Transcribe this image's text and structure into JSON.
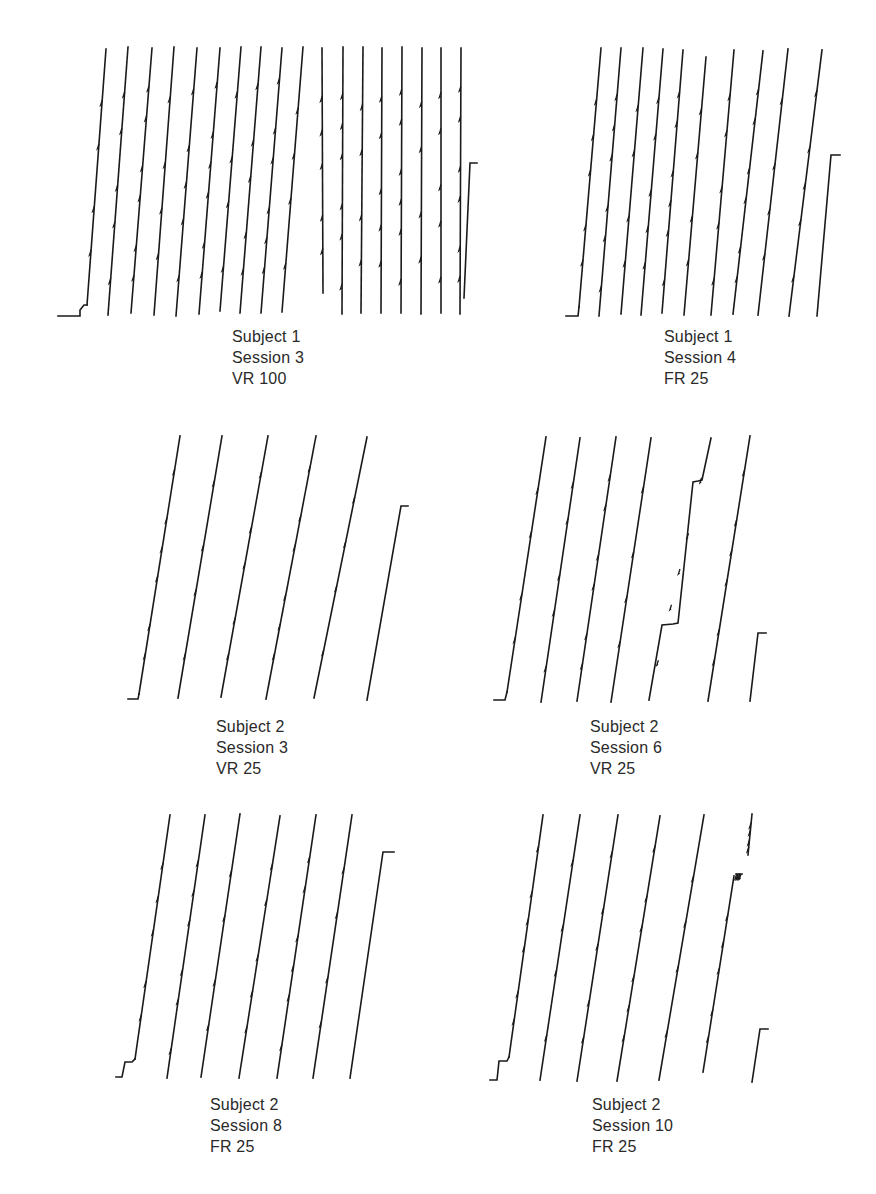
{
  "figure": {
    "type": "cumulative_records"
  },
  "panels": [
    {
      "id": "p1",
      "caption": {
        "subject": "Subject 1",
        "session": "Session 3",
        "schedule": "VR 100"
      },
      "caption_pos": [
        232,
        326
      ],
      "start_step": [
        [
          58,
          316
        ],
        [
          80,
          316
        ],
        [
          80,
          310
        ],
        [
          84,
          305
        ],
        [
          87,
          305
        ]
      ],
      "strokes": [
        [
          87,
          305,
          106,
          49
        ],
        [
          108,
          315,
          128,
          47
        ],
        [
          131,
          313,
          152,
          48
        ],
        [
          154,
          315,
          174,
          47
        ],
        [
          176,
          316,
          197,
          48
        ],
        [
          199,
          314,
          220,
          48
        ],
        [
          220,
          311,
          241,
          47
        ],
        [
          240,
          313,
          261,
          47
        ],
        [
          261,
          313,
          282,
          48
        ],
        [
          282,
          312,
          303,
          47
        ],
        [
          323,
          293,
          322,
          48
        ],
        [
          342,
          314,
          343,
          47
        ],
        [
          361,
          313,
          363,
          47
        ],
        [
          381,
          313,
          382,
          48
        ],
        [
          401,
          313,
          402,
          47
        ],
        [
          421,
          314,
          422,
          48
        ],
        [
          441,
          313,
          441,
          48
        ],
        [
          460,
          314,
          461,
          48
        ]
      ],
      "end_segment": [
        [
          464,
          298
        ],
        [
          470,
          163
        ],
        [
          477,
          163
        ]
      ]
    },
    {
      "id": "p2",
      "caption": {
        "subject": "Subject 1",
        "session": "Session 4",
        "schedule": "FR 25"
      },
      "caption_pos": [
        664,
        326
      ],
      "start_step": [
        [
          566,
          316
        ],
        [
          578,
          316
        ],
        [
          579,
          307
        ]
      ],
      "strokes": [
        [
          579,
          307,
          601,
          48
        ],
        [
          599,
          316,
          621,
          48
        ],
        [
          621,
          314,
          643,
          48
        ],
        [
          641,
          315,
          663,
          49
        ],
        [
          662,
          313,
          683,
          50
        ],
        [
          684,
          315,
          706,
          57
        ],
        [
          711,
          315,
          734,
          50
        ],
        [
          733,
          314,
          763,
          51
        ],
        [
          758,
          315,
          788,
          49
        ],
        [
          789,
          316,
          822,
          50
        ]
      ],
      "end_segment": [
        [
          817,
          316
        ],
        [
          831,
          155
        ],
        [
          840,
          155
        ]
      ]
    },
    {
      "id": "p3",
      "caption": {
        "subject": "Subject 2",
        "session": "Session 3",
        "schedule": "VR 25"
      },
      "caption_pos": [
        216,
        716
      ],
      "start_step": [
        [
          128,
          699
        ],
        [
          138,
          699
        ],
        [
          139,
          694
        ]
      ],
      "strokes": [
        [
          139,
          694,
          180,
          436
        ],
        [
          178,
          698,
          222,
          436
        ],
        [
          221,
          697,
          268,
          436
        ],
        [
          266,
          699,
          316,
          436
        ],
        [
          314,
          698,
          367,
          437
        ]
      ],
      "end_segment": [
        [
          367,
          700
        ],
        [
          401,
          506
        ],
        [
          408,
          506
        ]
      ]
    },
    {
      "id": "p4",
      "caption": {
        "subject": "Subject 2",
        "session": "Session 6",
        "schedule": "VR 25"
      },
      "caption_pos": [
        590,
        716
      ],
      "start_step": [
        [
          494,
          700
        ],
        [
          505,
          700
        ],
        [
          507,
          692
        ]
      ],
      "strokes": [
        [
          507,
          692,
          546,
          437
        ],
        [
          541,
          702,
          580,
          438
        ],
        [
          577,
          701,
          616,
          437
        ],
        [
          611,
          702,
          651,
          438
        ],
        [
          649,
          700,
          662,
          625,
          673,
          624,
          678,
          623,
          693,
          482,
          698,
          481,
          702,
          480,
          711,
          438
        ],
        [
          708,
          701,
          750,
          436
        ]
      ],
      "end_segment": [
        [
          750,
          701
        ],
        [
          758,
          633
        ],
        [
          766,
          633
        ]
      ]
    },
    {
      "id": "p5",
      "caption": {
        "subject": "Subject 2",
        "session": "Session 8",
        "schedule": "FR 25"
      },
      "caption_pos": [
        210,
        1094
      ],
      "start_step": [
        [
          116,
          1077
        ],
        [
          122,
          1077
        ],
        [
          125,
          1062
        ],
        [
          132,
          1062
        ],
        [
          135,
          1059
        ]
      ],
      "strokes": [
        [
          135,
          1059,
          170,
          815
        ],
        [
          167,
          1078,
          205,
          815
        ],
        [
          201,
          1077,
          240,
          814
        ],
        [
          239,
          1078,
          280,
          816
        ],
        [
          277,
          1078,
          316,
          815
        ],
        [
          313,
          1078,
          352,
          815
        ]
      ],
      "end_segment": [
        [
          350,
          1078
        ],
        [
          383,
          852
        ],
        [
          394,
          852
        ]
      ]
    },
    {
      "id": "p6",
      "caption": {
        "subject": "Subject 2",
        "session": "Session 10",
        "schedule": "FR 25"
      },
      "caption_pos": [
        592,
        1094
      ],
      "start_step": [
        [
          490,
          1080
        ],
        [
          497,
          1080
        ],
        [
          499,
          1061
        ],
        [
          507,
          1061
        ],
        [
          509,
          1057
        ]
      ],
      "strokes": [
        [
          509,
          1057,
          543,
          815
        ],
        [
          540,
          1080,
          580,
          815
        ],
        [
          577,
          1081,
          618,
          815
        ],
        [
          617,
          1081,
          660,
          816
        ],
        [
          659,
          1080,
          704,
          815
        ],
        [
          703,
          1072,
          734,
          876
        ],
        [
          736,
          874,
          742,
          874
        ],
        [
          748,
          855,
          752,
          814
        ]
      ],
      "end_segment": [
        [
          752,
          1082
        ],
        [
          760,
          1029
        ],
        [
          768,
          1029
        ]
      ]
    }
  ],
  "chart_data": {
    "type": "line",
    "title": "",
    "xlabel": "Time",
    "ylabel": "Cumulative responses",
    "grid": false,
    "legend": "none",
    "subplots": [
      {
        "title": "Subject 1 Session 3 VR 100",
        "subject": 1,
        "session": 3,
        "schedule": "VR 100",
        "full_excursions": 18,
        "final_partial_excursion_fraction": 0.55
      },
      {
        "title": "Subject 1 Session 4 FR 25",
        "subject": 1,
        "session": 4,
        "schedule": "FR 25",
        "full_excursions": 10,
        "final_partial_excursion_fraction": 0.6
      },
      {
        "title": "Subject 2 Session 3 VR 25",
        "subject": 2,
        "session": 3,
        "schedule": "VR 25",
        "full_excursions": 5,
        "final_partial_excursion_fraction": 0.74
      },
      {
        "title": "Subject 2 Session 6 VR 25",
        "subject": 2,
        "session": 6,
        "schedule": "VR 25",
        "full_excursions": 6,
        "final_partial_excursion_fraction": 0.26,
        "pauses": 2
      },
      {
        "title": "Subject 2 Session 8 FR 25",
        "subject": 2,
        "session": 8,
        "schedule": "FR 25",
        "full_excursions": 6,
        "final_partial_excursion_fraction": 0.86
      },
      {
        "title": "Subject 2 Session 10 FR 25",
        "subject": 2,
        "session": 10,
        "schedule": "FR 25",
        "full_excursions": 6,
        "final_partial_excursion_fraction": 0.2,
        "pauses": 1
      }
    ]
  }
}
